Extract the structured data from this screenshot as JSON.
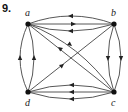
{
  "problem_number": "9.",
  "vertices": [
    {
      "id": "a",
      "label": "a",
      "x": 28,
      "y": 24
    },
    {
      "id": "b",
      "label": "b",
      "x": 114,
      "y": 24
    },
    {
      "id": "c",
      "label": "c",
      "x": 114,
      "y": 92
    },
    {
      "id": "d",
      "label": "d",
      "x": 28,
      "y": 92
    }
  ],
  "edges": [
    {
      "from": "b",
      "to": "a",
      "shape": "arc-up"
    },
    {
      "from": "a",
      "to": "b",
      "shape": "straight"
    },
    {
      "from": "b",
      "to": "a",
      "shape": "arc-down"
    },
    {
      "from": "d",
      "to": "a",
      "shape": "arc-left"
    },
    {
      "from": "d",
      "to": "a",
      "shape": "arc-right"
    },
    {
      "from": "b",
      "to": "c",
      "shape": "arc-left"
    },
    {
      "from": "b",
      "to": "c",
      "shape": "arc-right"
    },
    {
      "from": "c",
      "to": "d",
      "shape": "arc-up"
    },
    {
      "from": "c",
      "to": "d",
      "shape": "straight"
    },
    {
      "from": "c",
      "to": "d",
      "shape": "arc-down"
    },
    {
      "from": "a",
      "to": "c",
      "shape": "curve"
    },
    {
      "from": "c",
      "to": "a",
      "shape": "straight"
    },
    {
      "from": "d",
      "to": "b",
      "shape": "straight"
    }
  ],
  "colors": {
    "edge": "#333333",
    "vertex": "#111111"
  }
}
